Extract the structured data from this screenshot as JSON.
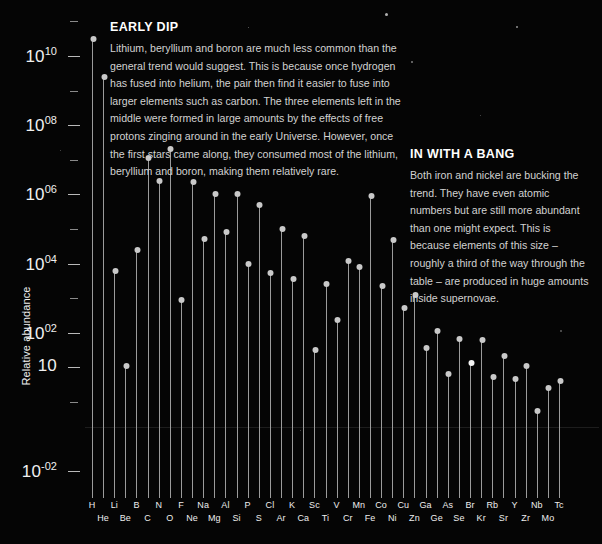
{
  "chart_data": {
    "type": "scatter",
    "title": "",
    "xlabel": "",
    "ylabel": "Relative abundance",
    "grid": false,
    "yscale": "log",
    "ylim": [
      0.01,
      100000000000
    ],
    "y_ticks_major": [
      {
        "label": "10",
        "sup": "10",
        "value": 10000000000
      },
      {
        "label": "10",
        "sup": "08",
        "value": 100000000
      },
      {
        "label": "10",
        "sup": "06",
        "value": 1000000
      },
      {
        "label": "10",
        "sup": "04",
        "value": 10000
      },
      {
        "label": "10",
        "sup": "02",
        "value": 100
      },
      {
        "label": "10",
        "sup": "",
        "value": 10
      },
      {
        "label": "10",
        "sup": "-02",
        "value": 0.01
      }
    ],
    "categories": [
      "H",
      "He",
      "Li",
      "Be",
      "B",
      "C",
      "N",
      "O",
      "F",
      "Ne",
      "Na",
      "Mg",
      "Al",
      "Si",
      "P",
      "S",
      "Cl",
      "Ar",
      "K",
      "Ca",
      "Sc",
      "Ti",
      "V",
      "Cr",
      "Mn",
      "Fe",
      "Co",
      "Ni",
      "Cu",
      "Zn",
      "Ga",
      "Ge",
      "As",
      "Se",
      "Br",
      "Kr",
      "Rb",
      "Sr",
      "Y",
      "Zr",
      "Nb",
      "Mo",
      "Tc"
    ],
    "values": [
      32000000000.0,
      2500000000.0,
      6000,
      11,
      25000,
      11000000.0,
      2400000.0,
      20000000.0,
      900,
      2300000.0,
      50000,
      1000000.0,
      80000,
      1000000.0,
      9500,
      500000.0,
      5200,
      100000.0,
      3500,
      62000,
      32,
      2500,
      240,
      12000,
      8000,
      900000.0,
      2200,
      48000,
      520,
      1200,
      36,
      110,
      6.6,
      68,
      13,
      60,
      5.3,
      22,
      4.6,
      11,
      0.55,
      2.5,
      4.0
    ],
    "highlight_index": 34,
    "marker_color": "#c9c9c9",
    "stem_color": "#9b9b9b"
  },
  "annotations": [
    {
      "id": "early-dip",
      "title": "EARLY DIP",
      "body": "Lithium, beryllium and boron are much less common than the general trend would suggest. This is because once hydrogen has fused into helium, the pair then find it easier to fuse into larger elements such as carbon. The three elements left in the middle were formed in large amounts by the effects of free protons zinging around in the early Universe. However, once the first stars came along, they consumed most of the lithium, beryllium and boron, making them relatively rare."
    },
    {
      "id": "in-with-a-bang",
      "title": "IN WITH A BANG",
      "body": "Both iron and nickel are bucking the trend. They have even atomic numbers but are still more abundant than one might expect. This is because elements of this size – roughly a third of the way through the table – are produced in huge amounts inside supernovae."
    }
  ],
  "theme": {
    "background": "#050505",
    "text": "#e8e8e8",
    "accent": "#ffffff"
  }
}
